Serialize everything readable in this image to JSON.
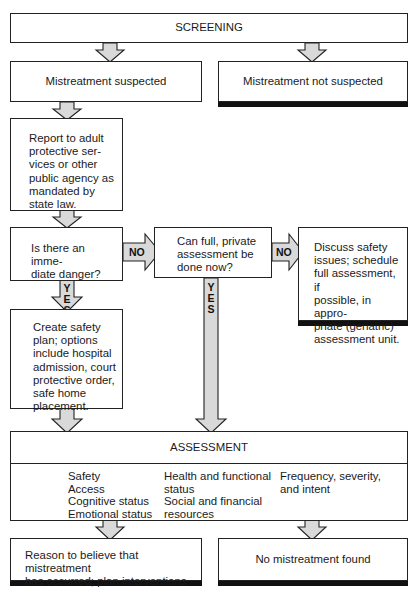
{
  "diagram": {
    "screening": "SCREENING",
    "suspected": "Mistreatment suspected",
    "not_suspected": "Mistreatment not suspected",
    "report": "Report to adult protective ser-vices or other public agency as mandated by state law.",
    "report_lines": [
      "Report to adult",
      "protective ser-",
      "vices or other",
      "public agency as",
      "mandated by",
      "state law."
    ],
    "danger_lines": [
      "Is there an imme-",
      "diate danger?"
    ],
    "can_full_lines": [
      "Can full, private",
      "assessment be",
      "done now?"
    ],
    "discuss_lines": [
      "Discuss safety",
      "issues; schedule",
      "full assessment, if",
      "possible, in appro-",
      "priate (geriatric)",
      "assessment unit."
    ],
    "safety_plan_lines": [
      "Create safety",
      "plan; options",
      "include hospital",
      "admission, court",
      "protective order,",
      "safe home",
      "placement."
    ],
    "assessment": {
      "title": "ASSESSMENT",
      "col1": [
        "Safety",
        "Access",
        "Cognitive status",
        "Emotional status"
      ],
      "col2": [
        "Health and functional",
        "status",
        "Social and financial",
        "resources"
      ],
      "col3": [
        "Frequency, severity,",
        "and intent"
      ]
    },
    "reason_lines": [
      "Reason to believe that  mistreatment",
      "has occurred;  plan interventions."
    ],
    "no_mistreatment": "No mistreatment found",
    "labels": {
      "no1": "NO",
      "no2": "NO",
      "yes1": [
        "Y",
        "E",
        "S"
      ],
      "yes2": [
        "Y",
        "E",
        "S"
      ]
    },
    "colors": {
      "arrow_fill": "#d9d9d9",
      "border": "#222222",
      "shadow": "#111111"
    }
  }
}
